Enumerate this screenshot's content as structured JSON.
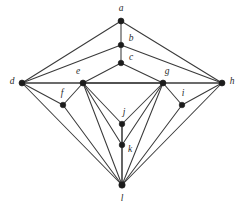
{
  "figure": {
    "width": 242,
    "height": 209,
    "background_color": "#ffffff",
    "edge_color": "#3a3a3a",
    "vertex_color": "#1c1c1c",
    "label_color": "#2a2a2a"
  },
  "graph_data": {
    "type": "node-link-diagram",
    "directed": false,
    "vertex_count": 12,
    "edge_count": 30,
    "vertices": [
      {
        "id": "a",
        "label": "a",
        "x": 121,
        "y": 21,
        "label_x": 121,
        "label_y": 9,
        "radius": 3.0
      },
      {
        "id": "b",
        "label": "b",
        "x": 121,
        "y": 45,
        "label_x": 131,
        "label_y": 39,
        "radius": 2.8
      },
      {
        "id": "c",
        "label": "c",
        "x": 121,
        "y": 63,
        "label_x": 131,
        "label_y": 58,
        "radius": 2.8
      },
      {
        "id": "d",
        "label": "d",
        "x": 22,
        "y": 83,
        "label_x": 12,
        "label_y": 82,
        "radius": 3.0
      },
      {
        "id": "e",
        "label": "e",
        "x": 83,
        "y": 83,
        "label_x": 78,
        "label_y": 72,
        "radius": 3.0
      },
      {
        "id": "f",
        "label": "f",
        "x": 63,
        "y": 105,
        "label_x": 62,
        "label_y": 94,
        "radius": 2.8
      },
      {
        "id": "g",
        "label": "g",
        "x": 163,
        "y": 83,
        "label_x": 167,
        "label_y": 72,
        "radius": 3.0
      },
      {
        "id": "h",
        "label": "h",
        "x": 222,
        "y": 83,
        "label_x": 232,
        "label_y": 82,
        "radius": 3.0
      },
      {
        "id": "i",
        "label": "i",
        "x": 182,
        "y": 105,
        "label_x": 183,
        "label_y": 94,
        "radius": 2.8
      },
      {
        "id": "j",
        "label": "j",
        "x": 122,
        "y": 124,
        "label_x": 124,
        "label_y": 113,
        "radius": 2.8
      },
      {
        "id": "k",
        "label": "k",
        "x": 122,
        "y": 145,
        "label_x": 130,
        "label_y": 150,
        "radius": 2.8
      },
      {
        "id": "l",
        "label": "l",
        "x": 122,
        "y": 185,
        "label_x": 122,
        "label_y": 199,
        "radius": 3.2
      }
    ],
    "edges": [
      {
        "source": "a",
        "target": "b"
      },
      {
        "source": "a",
        "target": "d"
      },
      {
        "source": "a",
        "target": "h"
      },
      {
        "source": "b",
        "target": "c"
      },
      {
        "source": "b",
        "target": "d"
      },
      {
        "source": "b",
        "target": "h"
      },
      {
        "source": "c",
        "target": "e"
      },
      {
        "source": "c",
        "target": "g"
      },
      {
        "source": "d",
        "target": "e"
      },
      {
        "source": "d",
        "target": "f"
      },
      {
        "source": "d",
        "target": "l"
      },
      {
        "source": "e",
        "target": "f"
      },
      {
        "source": "e",
        "target": "g"
      },
      {
        "source": "e",
        "target": "j"
      },
      {
        "source": "e",
        "target": "k"
      },
      {
        "source": "e",
        "target": "l"
      },
      {
        "source": "f",
        "target": "l"
      },
      {
        "source": "g",
        "target": "h"
      },
      {
        "source": "g",
        "target": "i"
      },
      {
        "source": "g",
        "target": "j"
      },
      {
        "source": "g",
        "target": "k"
      },
      {
        "source": "g",
        "target": "l"
      },
      {
        "source": "h",
        "target": "i"
      },
      {
        "source": "h",
        "target": "l"
      },
      {
        "source": "i",
        "target": "l"
      },
      {
        "source": "j",
        "target": "k"
      },
      {
        "source": "k",
        "target": "l"
      },
      {
        "source": "e",
        "target": "h"
      },
      {
        "source": "d",
        "target": "g"
      },
      {
        "source": "j",
        "target": "l"
      }
    ]
  }
}
